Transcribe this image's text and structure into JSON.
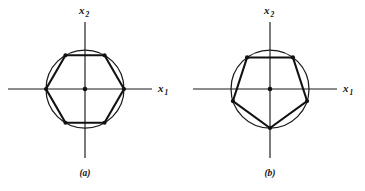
{
  "figure": {
    "background_color": "#ffffff",
    "ink_color": "#111111",
    "panels": [
      {
        "id": "panel-a",
        "caption": "(a)",
        "caption_x": 85,
        "caption_y": 176,
        "center": {
          "x": 85,
          "y": 89
        },
        "circle_radius": 39,
        "polygon": {
          "name": "hexagon",
          "sides": 6,
          "vertex_angles_deg": [
            0,
            60,
            120,
            180,
            240,
            300
          ],
          "circumradius": 39,
          "vertex_dot_radius": 2.1
        },
        "axes": {
          "x_axis": {
            "label": "x",
            "subscript": "1",
            "x_start": 8,
            "x_end": 152,
            "y": 89,
            "label_x": 158,
            "label_y": 92
          },
          "y_axis": {
            "label": "x",
            "subscript": "2",
            "y_start": 22,
            "y_end": 158,
            "x": 85,
            "label_x": 79,
            "label_y": 14
          }
        }
      },
      {
        "id": "panel-b",
        "caption": "(b)",
        "caption_x": 270,
        "caption_y": 176,
        "center": {
          "x": 270,
          "y": 89
        },
        "circle_radius": 39,
        "polygon": {
          "name": "pentagon",
          "sides": 5,
          "vertex_angles_deg": [
            270,
            342,
            54,
            126,
            198
          ],
          "circumradius": 39,
          "vertex_dot_radius": 2.1
        },
        "axes": {
          "x_axis": {
            "label": "x",
            "subscript": "1",
            "x_start": 193,
            "x_end": 337,
            "y": 89,
            "label_x": 343,
            "label_y": 92
          },
          "y_axis": {
            "label": "x",
            "subscript": "2",
            "y_start": 22,
            "y_end": 158,
            "x": 270,
            "label_x": 264,
            "label_y": 14
          }
        }
      }
    ]
  }
}
